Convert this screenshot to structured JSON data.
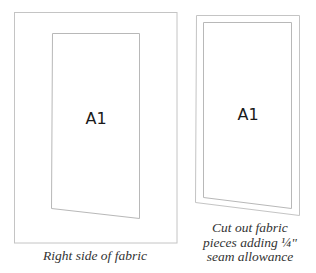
{
  "left_panel": {
    "piece_label": "A1",
    "caption": "Right side of fabric"
  },
  "right_panel": {
    "piece_label": "A1",
    "caption_lines": [
      "Cut out fabric",
      "pieces adding ¼\"",
      "seam allowance"
    ]
  },
  "colors": {
    "line": "#bdbdbd",
    "text": "#1a1a1a",
    "caption": "#333333",
    "background": "#ffffff"
  }
}
